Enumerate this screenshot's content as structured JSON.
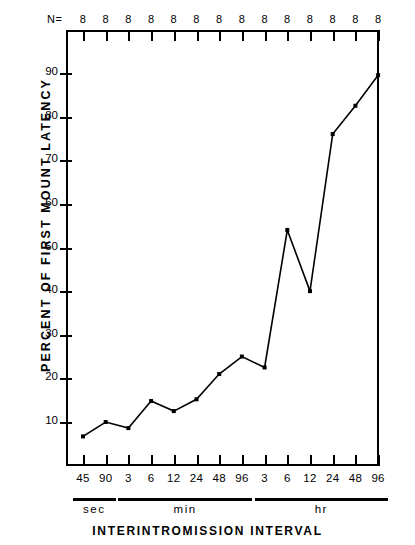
{
  "chart_data": {
    "type": "line",
    "title": "",
    "xlabel": "INTERINTROMISSION INTERVAL",
    "ylabel": "PERCENT OF FIRST MOUNT LATENCY",
    "ylim": [
      0,
      95
    ],
    "yticks": [
      10,
      20,
      30,
      40,
      50,
      60,
      70,
      80,
      90
    ],
    "ytick_labels": [
      "10",
      "20",
      "30",
      "40",
      "50",
      "60",
      "70",
      "80",
      "90"
    ],
    "grid": false,
    "legend": null,
    "categories": [
      "45",
      "90",
      "3",
      "6",
      "12",
      "24",
      "48",
      "96",
      "3",
      "6",
      "12",
      "24",
      "48",
      "96"
    ],
    "values": [
      6.7,
      10.0,
      8.6,
      14.8,
      12.5,
      15.2,
      21.0,
      25.0,
      22.5,
      54.0,
      40.0,
      76.0,
      82.5,
      89.5
    ],
    "marker": "filled-square",
    "line_color": "#000000",
    "top_axis_label": "N=",
    "top_axis_values": [
      "8",
      "8",
      "8",
      "8",
      "8",
      "8",
      "8",
      "8",
      "8",
      "8",
      "8",
      "8",
      "8",
      "8"
    ],
    "groups": [
      {
        "name": "sec",
        "labels": [
          "45",
          "90"
        ],
        "start_index": 0,
        "end_index": 1
      },
      {
        "name": "min",
        "labels": [
          "3",
          "6",
          "12",
          "24",
          "48",
          "96"
        ],
        "start_index": 2,
        "end_index": 7
      },
      {
        "name": "hr",
        "labels": [
          "3",
          "6",
          "12",
          "24",
          "48",
          "96"
        ],
        "start_index": 8,
        "end_index": 13
      }
    ]
  }
}
